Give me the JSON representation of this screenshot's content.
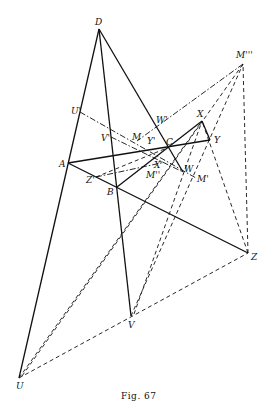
{
  "caption": "Fig. 67",
  "points": {
    "D": {
      "label": "D",
      "x": 99,
      "y": 29
    },
    "Mppp": {
      "label": "M'''",
      "x": 243,
      "y": 64
    },
    "Up": {
      "label": "U'",
      "x": 80,
      "y": 112
    },
    "Wp": {
      "label": "W'",
      "x": 163,
      "y": 120
    },
    "X": {
      "label": "X",
      "x": 202,
      "y": 121
    },
    "Vp": {
      "label": "V'",
      "x": 111,
      "y": 137
    },
    "M": {
      "label": "M",
      "x": 137,
      "y": 141
    },
    "Yp": {
      "label": "Y'",
      "x": 152,
      "y": 142
    },
    "C": {
      "label": "C",
      "x": 167,
      "y": 148
    },
    "Y": {
      "label": "Y",
      "x": 210,
      "y": 140
    },
    "A": {
      "label": "A",
      "x": 68,
      "y": 163
    },
    "Xp": {
      "label": "X'",
      "x": 161,
      "y": 163
    },
    "W": {
      "label": "W",
      "x": 183,
      "y": 172
    },
    "Mpp": {
      "label": "M''",
      "x": 150,
      "y": 174
    },
    "Mp": {
      "label": "M'",
      "x": 196,
      "y": 178
    },
    "Zp": {
      "label": "Z'",
      "x": 96,
      "y": 177
    },
    "B": {
      "label": "B",
      "x": 117,
      "y": 187
    },
    "Z": {
      "label": "Z",
      "x": 248,
      "y": 253
    },
    "V": {
      "label": "V",
      "x": 131,
      "y": 316
    },
    "U": {
      "label": "U",
      "x": 19,
      "y": 378
    }
  }
}
